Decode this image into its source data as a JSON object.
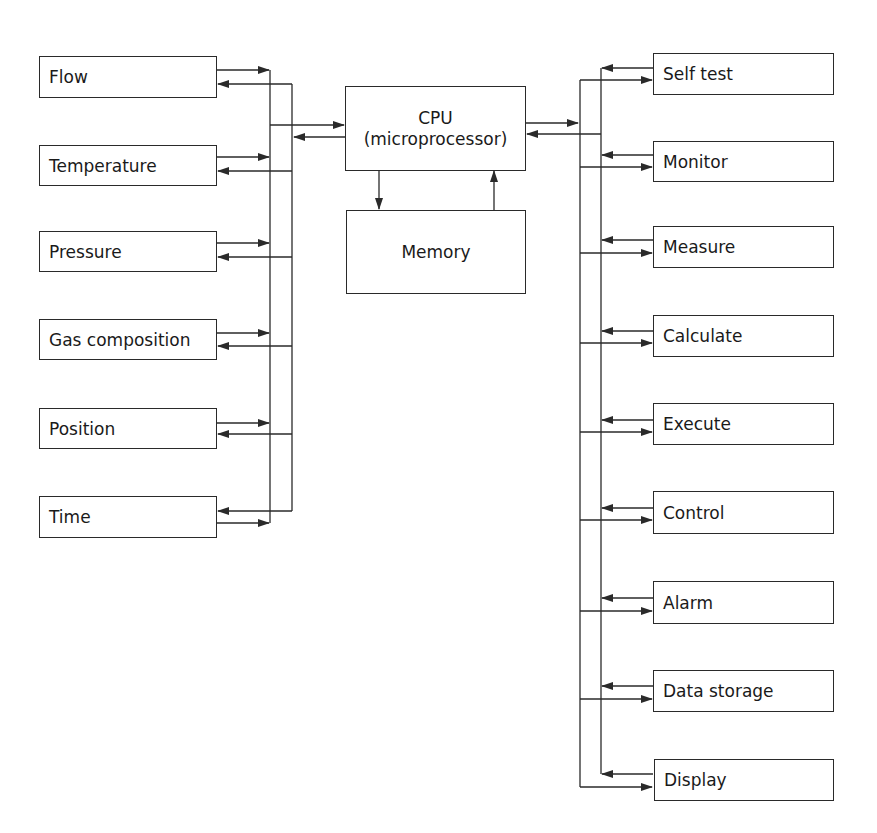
{
  "diagram": {
    "type": "block diagram",
    "cpu": {
      "title": "CPU",
      "subtitle": "(microprocessor)"
    },
    "memory": {
      "label": "Memory"
    },
    "inputs": [
      {
        "label": "Flow"
      },
      {
        "label": "Temperature"
      },
      {
        "label": "Pressure"
      },
      {
        "label": "Gas composition"
      },
      {
        "label": "Position"
      },
      {
        "label": "Time"
      }
    ],
    "functions": [
      {
        "label": "Self test"
      },
      {
        "label": "Monitor"
      },
      {
        "label": "Measure"
      },
      {
        "label": "Calculate"
      },
      {
        "label": "Execute"
      },
      {
        "label": "Control"
      },
      {
        "label": "Alarm"
      },
      {
        "label": "Data storage"
      },
      {
        "label": "Display"
      }
    ],
    "connections": [
      {
        "from": "inputs",
        "to": "CPU",
        "type": "bidirectional bus"
      },
      {
        "from": "CPU",
        "to": "Memory",
        "type": "arrow"
      },
      {
        "from": "Memory",
        "to": "CPU",
        "type": "arrow"
      },
      {
        "from": "CPU",
        "to": "functions",
        "type": "bidirectional bus"
      }
    ]
  },
  "colors": {
    "line": "#2a2a2a",
    "background": "#ffffff"
  }
}
